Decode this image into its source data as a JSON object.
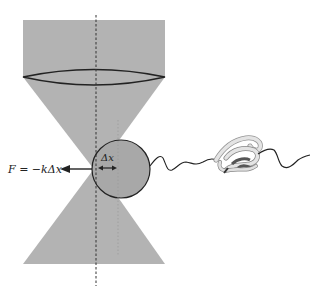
{
  "labels": {
    "force_equation": "F = −kΔx",
    "displacement": "Δx"
  },
  "elements": {
    "laser_beam": "focused laser beam (gray)",
    "lens": "objective lens",
    "trap_center_axis": "dashed vertical axis at trap center",
    "bead": "trapped bead",
    "tether": "polymer linker",
    "protein": "folded protein (ribbon)"
  },
  "colors": {
    "beam": "#b3b3b3",
    "bead": "#a8a8a8",
    "stroke": "#222222",
    "protein": "#dcdcdc"
  }
}
